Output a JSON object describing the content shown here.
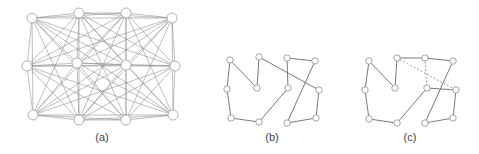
{
  "figure": {
    "panels": [
      {
        "id": "a",
        "label": "(a)",
        "label_x": 102,
        "description": "complete graph on 12 nodes",
        "nodes": [
          [
            32,
            18
          ],
          [
            79,
            13
          ],
          [
            126,
            13
          ],
          [
            172,
            18
          ],
          [
            27,
            66
          ],
          [
            77,
            63
          ],
          [
            126,
            65
          ],
          [
            175,
            66
          ],
          [
            33,
            115
          ],
          [
            79,
            120
          ],
          [
            126,
            120
          ],
          [
            173,
            115
          ]
        ],
        "node_radius": 5,
        "edges": "complete"
      },
      {
        "id": "b",
        "label": "(b)",
        "label_x": 272,
        "description": "tour (Hamiltonian cycle)",
        "nodes": [
          [
            230,
            60
          ],
          [
            259,
            57
          ],
          [
            287,
            58
          ],
          [
            315,
            61
          ],
          [
            227,
            89
          ],
          [
            257,
            88
          ],
          [
            288,
            88
          ],
          [
            319,
            90
          ],
          [
            231,
            118
          ],
          [
            259,
            122
          ],
          [
            287,
            123
          ],
          [
            316,
            118
          ]
        ],
        "node_radius": 3.2,
        "cycle": [
          0,
          4,
          8,
          9,
          6,
          2,
          3,
          10,
          11,
          7,
          1,
          5,
          0
        ]
      },
      {
        "id": "c",
        "label": "(c)",
        "label_x": 410,
        "description": "tour with dotted alternative edges",
        "nodes": [
          [
            369,
            61
          ],
          [
            397,
            58
          ],
          [
            425,
            58
          ],
          [
            453,
            61
          ],
          [
            365,
            90
          ],
          [
            395,
            88
          ],
          [
            427,
            88
          ],
          [
            456,
            90
          ],
          [
            369,
            119
          ],
          [
            397,
            123
          ],
          [
            425,
            123
          ],
          [
            453,
            118
          ]
        ],
        "node_radius": 3.2,
        "solid_path": [
          0,
          4,
          8,
          9,
          6,
          7,
          11,
          10,
          3,
          2,
          1,
          5,
          0
        ],
        "dotted_edges": [
          [
            1,
            7
          ],
          [
            2,
            6
          ]
        ]
      }
    ]
  },
  "colors": {
    "background": "#ffffff",
    "edge": "#6a6a6a",
    "node_fill": "#ffffff",
    "node_stroke": "#9a9a9a",
    "label": "#444444"
  }
}
